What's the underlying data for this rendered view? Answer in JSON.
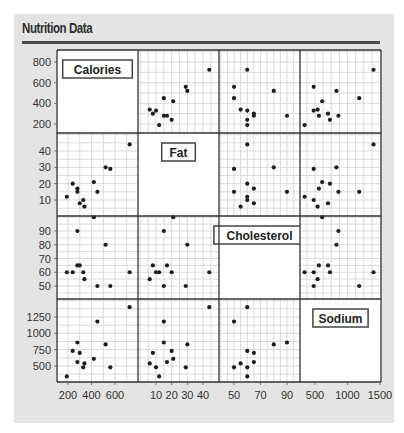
{
  "title": "Nutrition Data",
  "chart_data": {
    "type": "scatter",
    "subtype": "scatterplot-matrix",
    "title": "Nutrition Data",
    "variables": [
      "Calories",
      "Fat",
      "Cholesterol",
      "Sodium"
    ],
    "axes": {
      "Calories": {
        "ticks": [
          200,
          400,
          600,
          800
        ],
        "y_ticks": [
          200,
          400,
          600,
          800
        ],
        "x_ticks": [
          200,
          400,
          600
        ],
        "range": [
          100,
          850
        ]
      },
      "Fat": {
        "ticks": [
          10,
          20,
          30,
          40
        ],
        "y_ticks": [
          10,
          20,
          30,
          40
        ],
        "x_ticks": [
          10,
          20,
          30,
          40
        ],
        "range": [
          0,
          48
        ]
      },
      "Cholesterol": {
        "ticks": [
          50,
          60,
          70,
          80,
          90
        ],
        "y_ticks": [
          50,
          60,
          70,
          80,
          90
        ],
        "x_ticks": [
          50,
          70,
          90
        ],
        "range": [
          40,
          100
        ]
      },
      "Sodium": {
        "ticks": [
          500,
          750,
          1000,
          1250
        ],
        "y_ticks": [
          500,
          750,
          1000,
          1250
        ],
        "x_ticks": [
          500,
          1000,
          1500
        ],
        "range": [
          300,
          1500
        ]
      }
    },
    "records": [
      {
        "Calories": 190,
        "Fat": 12,
        "Cholesterol": 60,
        "Sodium": 340
      },
      {
        "Calories": 280,
        "Fat": 17,
        "Cholesterol": 65,
        "Sodium": 560
      },
      {
        "Calories": 280,
        "Fat": 15,
        "Cholesterol": 90,
        "Sodium": 860
      },
      {
        "Calories": 300,
        "Fat": 8,
        "Cholesterol": 65,
        "Sodium": 700
      },
      {
        "Calories": 340,
        "Fat": 6,
        "Cholesterol": 55,
        "Sodium": 540
      },
      {
        "Calories": 420,
        "Fat": 21,
        "Cholesterol": 100,
        "Sodium": 610
      },
      {
        "Calories": 450,
        "Fat": 15,
        "Cholesterol": 50,
        "Sodium": 1180
      },
      {
        "Calories": 240,
        "Fat": 20,
        "Cholesterol": 60,
        "Sodium": 730
      },
      {
        "Calories": 520,
        "Fat": 30,
        "Cholesterol": 80,
        "Sodium": 830
      },
      {
        "Calories": 560,
        "Fat": 29,
        "Cholesterol": 50,
        "Sodium": 480
      },
      {
        "Calories": 725,
        "Fat": 44,
        "Cholesterol": 60,
        "Sodium": 1400
      },
      {
        "Calories": 330,
        "Fat": 10,
        "Cholesterol": 60,
        "Sodium": 480
      }
    ],
    "grid": true,
    "legend": "none",
    "xlabel": "",
    "ylabel": ""
  },
  "colors": {
    "background": "#e4e4e4",
    "panel": "#ffffff",
    "grid": "#d2d2d2",
    "border": "#333333",
    "point": "#1e1e1e",
    "rule": "#4a4a4a"
  }
}
